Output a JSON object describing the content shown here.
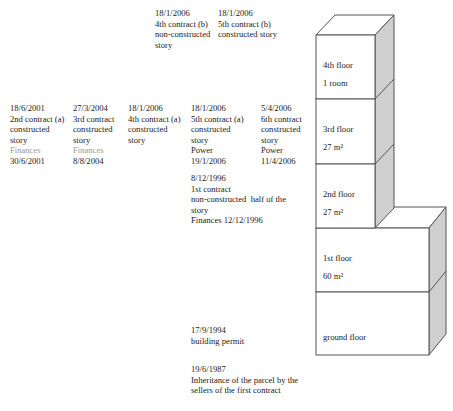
{
  "timeline": {
    "row_top": [
      {
        "id": "c4b",
        "date": "18/1/2006",
        "lines": [
          "4th contract (b)",
          "non-constructed",
          "story"
        ],
        "x": 155,
        "y": 8
      },
      {
        "id": "c5b",
        "date": "18/1/2006",
        "lines": [
          "5th contract (b)",
          "constructed story"
        ],
        "x": 218,
        "y": 8
      }
    ],
    "row_mid": [
      {
        "id": "c2a",
        "date": "18/6/2001",
        "lines": [
          "2nd contract (a)",
          "constructed",
          "story"
        ],
        "muted": "Finances",
        "extra": [
          "30/6/2001"
        ],
        "x": 10,
        "y": 103
      },
      {
        "id": "c3",
        "date": "27/3/2004",
        "lines": [
          "3rd contract",
          "constructed",
          "story"
        ],
        "muted": "Finances",
        "extra": [
          "8/8/2004"
        ],
        "x": 73,
        "y": 103
      },
      {
        "id": "c4a",
        "date": "18/1/2006",
        "lines": [
          "4th contract (a)",
          "constructed",
          "story"
        ],
        "x": 128,
        "y": 103
      },
      {
        "id": "c5a",
        "date": "18/1/2006",
        "lines": [
          "5th contract (a)",
          "constructed",
          "story",
          "Power",
          "19/1/2006"
        ],
        "x": 191,
        "y": 103
      },
      {
        "id": "c6",
        "date": "5/4/2006",
        "lines": [
          "6th contract",
          "constructed",
          "story",
          "Power",
          "11/4/2006"
        ],
        "x": 261,
        "y": 103
      }
    ],
    "row_first": {
      "id": "c1",
      "date": "8/12/1996",
      "lines": [
        "1st contract",
        "non-constructed  half of the",
        "story",
        "Finances 12/12/1996"
      ],
      "x": 191,
      "y": 173
    },
    "permit": {
      "date": "17/9/1994",
      "lines": [
        "building permit"
      ],
      "x": 191,
      "y": 324
    },
    "inheritance": {
      "date": "19/6/1987",
      "lines": [
        "Inheritance of the parcel by the",
        "sellers of the first contract"
      ],
      "x": 191,
      "y": 363
    }
  },
  "building": {
    "floors": [
      {
        "id": "floor-4",
        "name": "4th floor",
        "area": "1 room"
      },
      {
        "id": "floor-3",
        "name": "3rd floor",
        "area": "27 m²"
      },
      {
        "id": "floor-2",
        "name": "2nd floor",
        "area": "27 m²"
      },
      {
        "id": "floor-1",
        "name": "1st floor",
        "area": "60 m²"
      },
      {
        "id": "floor-ground",
        "name": "ground floor",
        "area": ""
      }
    ],
    "colors": {
      "side_fill": "#cfcfcf",
      "front_fill": "#ffffff",
      "stroke": "#555555"
    }
  }
}
